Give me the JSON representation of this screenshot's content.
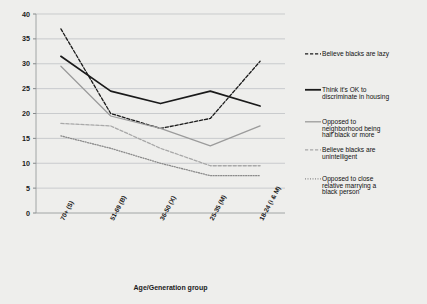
{
  "chart_data": {
    "type": "line",
    "title": "",
    "xlabel": "Age/Generation group",
    "ylabel": "",
    "ylim": [
      0,
      40
    ],
    "ytick_step": 5,
    "yticks": [
      0,
      5,
      10,
      15,
      20,
      25,
      30,
      35,
      40
    ],
    "grid": true,
    "legend_position": "right",
    "categories": [
      "70+ (S)",
      "51-69 (B)",
      "36-50 (X)",
      "25-35 (M)",
      "18-24 (i & M)"
    ],
    "series": [
      {
        "name": "Believe blacks are lazy",
        "style": "dashed",
        "color": "#1a1a1a",
        "values": [
          37.0,
          20.0,
          17.0,
          19.0,
          30.5
        ]
      },
      {
        "name": "Think it's OK to discriminate in housing",
        "style": "solid",
        "color": "#1a1a1a",
        "values": [
          31.5,
          24.5,
          22.0,
          24.5,
          21.5
        ]
      },
      {
        "name": "Opposed to neighborhood being half black or more",
        "style": "solid",
        "color": "#9b9b9b",
        "values": [
          29.5,
          19.5,
          17.0,
          13.5,
          17.5
        ]
      },
      {
        "name": "Believe blacks are unintelligent",
        "style": "dashed",
        "color": "#a8a8a8",
        "values": [
          18.0,
          17.5,
          13.0,
          9.5,
          9.5
        ]
      },
      {
        "name": "Opposed to close relative marrying a black person",
        "style": "dotted",
        "color": "#8a8a8a",
        "values": [
          15.5,
          13.0,
          10.0,
          7.5,
          7.5
        ]
      }
    ]
  },
  "legend": {
    "items": [
      {
        "label": "Believe blacks are lazy",
        "label_line2": ""
      },
      {
        "label": "Think it's OK to",
        "label_line2": "discriminate in housing"
      },
      {
        "label": "Opposed to",
        "label_line2": "neighborhood being",
        "label_line3": "half black or more"
      },
      {
        "label": "Believe blacks are",
        "label_line2": "unintelligent"
      },
      {
        "label": "Opposed to close",
        "label_line2": "relative marrying a",
        "label_line3": "black person"
      }
    ]
  }
}
